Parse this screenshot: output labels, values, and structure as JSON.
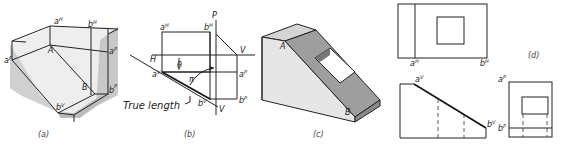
{
  "figure": {
    "panels": [
      {
        "id": "a",
        "caption": "(a)",
        "labels": {
          "aH": "a",
          "aH_sup": "H",
          "bH": "b",
          "bH_sup": "H",
          "aF": "a",
          "aF_sup": "F",
          "aP": "a",
          "aP_sup": "P",
          "A": "A",
          "B": "B",
          "bV": "b",
          "bV_sup": "V",
          "bP": "b",
          "bP_sup": "P"
        }
      },
      {
        "id": "b",
        "caption": "(b)",
        "labels": {
          "P": "P",
          "H": "H",
          "V_top": "V",
          "V_bottom": "V",
          "aH": "a",
          "aH_sup": "H",
          "bH": "b",
          "bH_sup": "H",
          "aV": "a",
          "aV_sup": "V",
          "bV": "b",
          "bV_sup": "V",
          "aP": "a",
          "aP_sup": "P",
          "bP": "b",
          "bP_sup": "P",
          "angle_theta": "θ",
          "angle_phi": "π",
          "true_length": "True length"
        }
      },
      {
        "id": "c",
        "caption": "(c)",
        "labels": {
          "A": "A",
          "B": "B"
        }
      },
      {
        "id": "d",
        "caption": "(d)",
        "labels": {
          "aH": "a",
          "aH_sup": "H",
          "bH": "b",
          "bH_sup": "H",
          "aV": "a",
          "aV_sup": "V",
          "bV": "b",
          "bV_sup": "V",
          "aP": "a",
          "aP_sup": "P",
          "bP": "b",
          "bP_sup": "P"
        }
      }
    ]
  },
  "colors": {
    "line": "#222222",
    "shade_light": "#d9d9d9",
    "shade_mid": "#bdbdbd",
    "shade_dark": "#9a9a9a"
  }
}
